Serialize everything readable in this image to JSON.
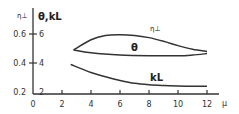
{
  "chart_data": {
    "type": "line",
    "title": "",
    "xlabel": "μ",
    "ylabel_left": "η⊥",
    "ylabel_right": "θ,kL",
    "xlim": [
      0,
      12
    ],
    "x_ticks": [
      "0",
      "2",
      "4",
      "6",
      "8",
      "10",
      "12"
    ],
    "y_ticks_eta": [
      "0.2",
      "0.4",
      "0.6"
    ],
    "y_ticks_theta_kl": [
      "2",
      "4",
      "6"
    ],
    "ylim_theta_kl": [
      2,
      6
    ],
    "ylim_eta": [
      0.2,
      0.6
    ],
    "grid": false,
    "series": [
      {
        "name": "η⊥",
        "axis": "eta",
        "x": [
          2.8,
          4,
          5,
          6,
          7,
          8,
          9,
          10,
          11,
          12
        ],
        "values": [
          0.49,
          0.56,
          0.59,
          0.595,
          0.59,
          0.575,
          0.55,
          0.52,
          0.495,
          0.48
        ]
      },
      {
        "name": "θ",
        "axis": "theta_kl",
        "x": [
          2.8,
          4,
          6,
          8,
          10,
          11,
          12
        ],
        "values": [
          4.9,
          4.7,
          4.55,
          4.5,
          4.5,
          4.55,
          4.65
        ]
      },
      {
        "name": "kL",
        "axis": "theta_kl",
        "x": [
          2.6,
          4,
          5,
          6,
          7,
          8,
          9,
          10,
          11,
          12
        ],
        "values": [
          3.9,
          3.35,
          3.05,
          2.8,
          2.6,
          2.5,
          2.45,
          2.42,
          2.4,
          2.4
        ]
      }
    ],
    "annotations": [
      "η⊥",
      "θ",
      "kL"
    ]
  },
  "labels": {
    "eta_axis": "η⊥",
    "theta_kl_axis": "θ,kL",
    "x_axis": "μ",
    "series_eta": "η⊥",
    "series_theta": "θ",
    "series_kl": "kL"
  }
}
